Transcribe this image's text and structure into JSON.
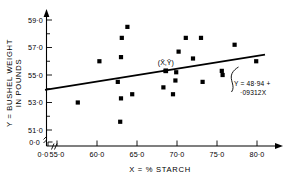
{
  "chart_data": {
    "type": "scatter",
    "title": "",
    "xlabel": "X = % STARCH",
    "ylabel": "Y = BUSHEL WEIGHT IN POUNDS",
    "ylabel_line1": "Y = BUSHEL WEIGHT",
    "ylabel_line2": "IN POUNDS",
    "xlim": [
      53.0,
      81.5
    ],
    "ylim": [
      50.6,
      59.6
    ],
    "grid": false,
    "legend": "none",
    "x_origin_label": "0·0",
    "y_origin_label": "0·0",
    "axis_break": true,
    "xticks": [
      55.0,
      60.0,
      65.0,
      70.0,
      75.0,
      80.0
    ],
    "xticklabels": [
      "55·0",
      "60·0",
      "65·0",
      "70·0",
      "75·0",
      "80·0"
    ],
    "yticks": [
      51.0,
      53.0,
      55.0,
      57.0,
      59.0
    ],
    "yticklabels": [
      "51·0",
      "53·0",
      "55·0",
      "57·0",
      "59·0"
    ],
    "y_minor_ticks": [
      52.0,
      54.0,
      56.0,
      58.0
    ],
    "points": [
      {
        "x": 57.6,
        "y": 53.0
      },
      {
        "x": 60.3,
        "y": 56.0
      },
      {
        "x": 62.9,
        "y": 51.6
      },
      {
        "x": 63.0,
        "y": 53.3
      },
      {
        "x": 63.0,
        "y": 56.3
      },
      {
        "x": 63.1,
        "y": 57.7
      },
      {
        "x": 63.8,
        "y": 58.5
      },
      {
        "x": 62.6,
        "y": 54.5
      },
      {
        "x": 64.4,
        "y": 53.6
      },
      {
        "x": 68.3,
        "y": 54.1
      },
      {
        "x": 68.6,
        "y": 55.3
      },
      {
        "x": 69.5,
        "y": 53.6
      },
      {
        "x": 69.8,
        "y": 54.6
      },
      {
        "x": 69.9,
        "y": 55.2
      },
      {
        "x": 70.2,
        "y": 56.7
      },
      {
        "x": 71.1,
        "y": 57.7
      },
      {
        "x": 72.0,
        "y": 56.2
      },
      {
        "x": 73.0,
        "y": 57.7
      },
      {
        "x": 73.2,
        "y": 54.5
      },
      {
        "x": 75.6,
        "y": 55.3
      },
      {
        "x": 75.7,
        "y": 55.0
      },
      {
        "x": 77.2,
        "y": 57.2
      },
      {
        "x": 79.9,
        "y": 56.0
      }
    ],
    "centroid": {
      "x": 68.6,
      "y": 55.3,
      "label": "(X̄,Ȳ)"
    },
    "regression": {
      "intercept": 48.94,
      "slope": 0.09312,
      "x_start": 53.5,
      "x_end": 81.0,
      "equation_line1": "Y = 48·94 +",
      "equation_line2": "·09312X"
    }
  }
}
